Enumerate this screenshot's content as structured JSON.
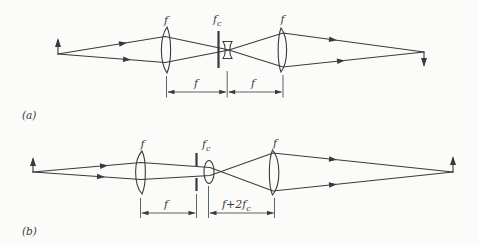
{
  "colors": {
    "ink": "#3a3a3a",
    "paper": "#fbfbf9"
  },
  "panels": {
    "a": {
      "label": "(a)",
      "lens_left_label": "f",
      "center_label": {
        "main": "f",
        "sub": "c"
      },
      "lens_right_label": "f",
      "dim_left": "f",
      "dim_right": "f"
    },
    "b": {
      "label": "(b)",
      "lens_left_label": "f",
      "center_label": {
        "main": "f",
        "sub": "c"
      },
      "lens_right_label": "f",
      "dim_left": "f",
      "dim_right": {
        "main": "f+2f",
        "sub": "c"
      }
    }
  }
}
